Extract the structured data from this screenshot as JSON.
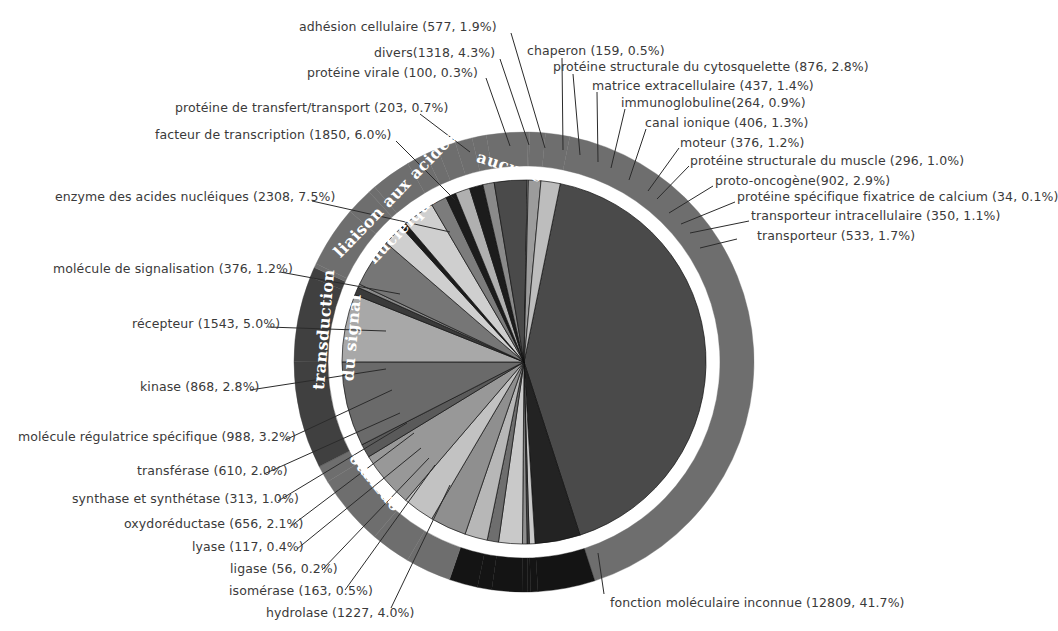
{
  "chart_data": {
    "type": "pie",
    "title": "",
    "subtitle": "",
    "xlabel": "",
    "ylabel": "",
    "legend_position": "callout-labels",
    "grid": false,
    "total": 30728,
    "center": {
      "x": 524,
      "y": 362
    },
    "outer_radius": 230,
    "ring_inner_radius": 196,
    "pie_radius": 182,
    "value_unit": "genes",
    "colors": {
      "dark_gray": "#404040",
      "mid_gray": "#6e6e6e",
      "light_gray": "#b7b7b7",
      "pale_gray": "#d2d2d2",
      "black": "#141414",
      "white": "#ffffff",
      "text": "#3a3a3a"
    },
    "groups": [
      {
        "name": "aucune",
        "fill": "#6e6e6e",
        "text_fill": "#ffffff"
      },
      {
        "name": "liaison aux acides nucléiques",
        "fill": "#404040",
        "text_fill": "#ffffff"
      },
      {
        "name": "transduction du signal",
        "fill": "#6e6e6e",
        "text_fill": "#ffffff"
      },
      {
        "name": "enzyme",
        "fill": "#141414",
        "text_fill": "#ffffff"
      },
      {
        "name": "",
        "fill": "#404040",
        "text_fill": "#ffffff"
      }
    ],
    "slices": [
      {
        "label": "fonction moléculaire inconnue",
        "value": 12809,
        "percent": 41.7,
        "fill": "#4a4a4a",
        "group": "aucune"
      },
      {
        "label": "hydrolase",
        "value": 1227,
        "percent": 4.0,
        "fill": "#232323",
        "group": "enzyme"
      },
      {
        "label": "isomérase",
        "value": 163,
        "percent": 0.5,
        "fill": "#c9c9c9",
        "group": "enzyme"
      },
      {
        "label": "ligase",
        "value": 56,
        "percent": 0.2,
        "fill": "#4a4a4a",
        "group": "enzyme"
      },
      {
        "label": "lyase",
        "value": 117,
        "percent": 0.4,
        "fill": "#8f8f8f",
        "group": "enzyme"
      },
      {
        "label": "oxydoréductase",
        "value": 656,
        "percent": 2.1,
        "fill": "#c9c9c9",
        "group": "enzyme"
      },
      {
        "label": "synthase et synthétase",
        "value": 313,
        "percent": 1.0,
        "fill": "#6e6e6e",
        "group": "enzyme"
      },
      {
        "label": "transférase",
        "value": 610,
        "percent": 2.0,
        "fill": "#b7b7b7",
        "group": "enzyme"
      },
      {
        "label": "molécule régulatrice spécifique",
        "value": 988,
        "percent": 3.2,
        "fill": "#8f8f8f",
        "group": "transduction du signal"
      },
      {
        "label": "kinase",
        "value": 868,
        "percent": 2.8,
        "fill": "#c2c2c2",
        "group": "transduction du signal"
      },
      {
        "label": "récepteur",
        "value": 1543,
        "percent": 5.0,
        "fill": "#989898",
        "group": "transduction du signal"
      },
      {
        "label": "molécule de signalisation",
        "value": 376,
        "percent": 1.2,
        "fill": "#5a5a5a",
        "group": "transduction du signal"
      },
      {
        "label": "enzyme des acides nucléiques",
        "value": 2308,
        "percent": 7.5,
        "fill": "#6a6a6a",
        "group": "liaison aux acides nucléiques"
      },
      {
        "label": "facteur de transcription",
        "value": 1850,
        "percent": 6.0,
        "fill": "#a8a8a8",
        "group": "liaison aux acides nucléiques"
      },
      {
        "label": "protéine de transfert/transport",
        "value": 203,
        "percent": 0.7,
        "fill": "#3a3a3a",
        "group": "liaison aux acides nucléiques"
      },
      {
        "label": "protéine virale",
        "value": 100,
        "percent": 0.3,
        "fill": "#8a8a8a",
        "group": "aucune"
      },
      {
        "label": "divers",
        "value": 1318,
        "percent": 4.3,
        "fill": "#767676",
        "group": "aucune"
      },
      {
        "label": "adhésion cellulaire",
        "value": 577,
        "percent": 1.9,
        "fill": "#cfcfcf",
        "group": "aucune"
      },
      {
        "label": "chaperon",
        "value": 159,
        "percent": 0.5,
        "fill": "#1c1c1c",
        "group": "aucune"
      },
      {
        "label": "protéine structurale du cytosquelette",
        "value": 876,
        "percent": 2.8,
        "fill": "#cfcfcf",
        "group": "aucune"
      },
      {
        "label": "matrice extracellulaire",
        "value": 437,
        "percent": 1.4,
        "fill": "#7c7c7c",
        "group": "aucune"
      },
      {
        "label": "immunoglobuline",
        "value": 264,
        "percent": 0.9,
        "fill": "#1c1c1c",
        "group": "aucune"
      },
      {
        "label": "canal ionique",
        "value": 406,
        "percent": 1.3,
        "fill": "#b0b0b0",
        "group": "aucune"
      },
      {
        "label": "moteur",
        "value": 376,
        "percent": 1.2,
        "fill": "#1c1c1c",
        "group": "aucune"
      },
      {
        "label": "protéine structurale du muscle",
        "value": 296,
        "percent": 1.0,
        "fill": "#8a8a8a",
        "group": "aucune"
      },
      {
        "label": "proto-oncogène",
        "value": 902,
        "percent": 2.9,
        "fill": "#4a4a4a",
        "group": "aucune"
      },
      {
        "label": "protéine spécifique fixatrice de calcium",
        "value": 34,
        "percent": 0.1,
        "fill": "#d8d8d8",
        "group": "aucune"
      },
      {
        "label": "transporteur intracellulaire",
        "value": 350,
        "percent": 1.1,
        "fill": "#9c9c9c",
        "group": "aucune"
      },
      {
        "label": "transporteur",
        "value": 533,
        "percent": 1.7,
        "fill": "#bdbdbd",
        "group": "aucune"
      }
    ]
  },
  "callouts": [
    {
      "id": "adhesion-cellulaire",
      "text": "adhésion cellulaire  (577, 1.9%)",
      "x": 299,
      "y": 20,
      "align": "left",
      "lx1": 511,
      "ly1": 33,
      "lx2": 545,
      "ly2": 148
    },
    {
      "id": "divers",
      "text": "divers(1318, 4.3%)",
      "x": 374,
      "y": 46,
      "align": "left",
      "lx1": 500,
      "ly1": 59,
      "lx2": 529,
      "ly2": 145
    },
    {
      "id": "proteine-virale",
      "text": "protéine virale  (100, 0.3%)",
      "x": 307,
      "y": 66,
      "align": "left",
      "lx1": 486,
      "ly1": 78,
      "lx2": 510,
      "ly2": 146
    },
    {
      "id": "chaperon",
      "text": "chaperon (159, 0.5%)",
      "x": 527,
      "y": 44,
      "align": "left",
      "lx1": 562,
      "ly1": 58,
      "lx2": 563,
      "ly2": 150
    },
    {
      "id": "cytosquelette",
      "text": "protéine structurale du cytosquelette  (876, 2.8%)",
      "x": 553,
      "y": 60,
      "align": "left",
      "lx1": 573,
      "ly1": 74,
      "lx2": 580,
      "ly2": 155
    },
    {
      "id": "matrice-extracellulaire",
      "text": "matrice extracellulaire (437, 1.4%)",
      "x": 592,
      "y": 79,
      "align": "left",
      "lx1": 597,
      "ly1": 92,
      "lx2": 598,
      "ly2": 162
    },
    {
      "id": "immunoglobuline",
      "text": "immunoglobuline(264, 0.9%)",
      "x": 621,
      "y": 96,
      "align": "left",
      "lx1": 625,
      "ly1": 109,
      "lx2": 611,
      "ly2": 168
    },
    {
      "id": "proteine-transfert",
      "text": "protéine de transfert/transport  (203, 0.7%)",
      "x": 175,
      "y": 101,
      "align": "left",
      "lx1": 420,
      "ly1": 114,
      "lx2": 470,
      "ly2": 152
    },
    {
      "id": "canal-ionique",
      "text": "canal ionique (406, 1.3%)",
      "x": 645,
      "y": 116,
      "align": "left",
      "lx1": 646,
      "ly1": 129,
      "lx2": 629,
      "ly2": 180
    },
    {
      "id": "facteur-transcription",
      "text": "facteur de transcription  (1850, 6.0%)",
      "x": 155,
      "y": 128,
      "align": "left",
      "lx1": 396,
      "ly1": 141,
      "lx2": 455,
      "ly2": 200
    },
    {
      "id": "moteur",
      "text": "moteur (376, 1.2%)",
      "x": 680,
      "y": 136,
      "align": "left",
      "lx1": 679,
      "ly1": 148,
      "lx2": 648,
      "ly2": 191
    },
    {
      "id": "muscle",
      "text": "protéine structurale du muscle (296, 1.0%)",
      "x": 690,
      "y": 154,
      "align": "left",
      "lx1": 689,
      "ly1": 166,
      "lx2": 657,
      "ly2": 199
    },
    {
      "id": "proto-oncogene",
      "text": "proto-oncogène(902, 2.9%)",
      "x": 715,
      "y": 174,
      "align": "left",
      "lx1": 713,
      "ly1": 186,
      "lx2": 669,
      "ly2": 213
    },
    {
      "id": "calcium",
      "text": "protéine spécifique fixatrice de calcium  (34, 0.1%)",
      "x": 737,
      "y": 190,
      "align": "left",
      "lx1": 735,
      "ly1": 202,
      "lx2": 681,
      "ly2": 224
    },
    {
      "id": "transporteur-intra",
      "text": "transporteur intracellulaire (350, 1.1%)",
      "x": 751,
      "y": 209,
      "align": "left",
      "lx1": 749,
      "ly1": 221,
      "lx2": 690,
      "ly2": 233
    },
    {
      "id": "transporteur",
      "text": "transporteur (533, 1.7%)",
      "x": 757,
      "y": 229,
      "align": "left",
      "lx1": 737,
      "ly1": 239,
      "lx2": 700,
      "ly2": 248
    },
    {
      "id": "enzyme-acides-nucl",
      "text": "enzyme des acides nucléiques (2308, 7.5%)",
      "x": 55,
      "y": 190,
      "align": "left",
      "lx1": 312,
      "ly1": 201,
      "lx2": 450,
      "ly2": 232
    },
    {
      "id": "molecule-signalisation",
      "text": "molécule de signalisation  (376, 1.2%)",
      "x": 53,
      "y": 262,
      "align": "left",
      "lx1": 280,
      "ly1": 272,
      "lx2": 400,
      "ly2": 294
    },
    {
      "id": "recepteur",
      "text": "récepteur (1543, 5.0%)",
      "x": 132,
      "y": 317,
      "align": "left",
      "lx1": 268,
      "ly1": 327,
      "lx2": 386,
      "ly2": 331
    },
    {
      "id": "kinase",
      "text": "kinase (868, 2.8%)",
      "x": 140,
      "y": 380,
      "align": "left",
      "lx1": 250,
      "ly1": 390,
      "lx2": 386,
      "ly2": 369
    },
    {
      "id": "molecule-regulatrice",
      "text": "molécule régulatrice spécifique (988, 3.2%)",
      "x": 18,
      "y": 430,
      "align": "left",
      "lx1": 285,
      "ly1": 440,
      "lx2": 392,
      "ly2": 390
    },
    {
      "id": "transferase",
      "text": "transférase (610, 2.0%)",
      "x": 137,
      "y": 464,
      "align": "left",
      "lx1": 264,
      "ly1": 474,
      "lx2": 400,
      "ly2": 413
    },
    {
      "id": "synthase",
      "text": "synthase et synthétase (313, 1.0%)",
      "x": 72,
      "y": 492,
      "align": "left",
      "lx1": 278,
      "ly1": 501,
      "lx2": 407,
      "ly2": 423
    },
    {
      "id": "oxydoreductase",
      "text": "oxydoréductase (656, 2.1%)",
      "x": 124,
      "y": 517,
      "align": "left",
      "lx1": 291,
      "ly1": 526,
      "lx2": 414,
      "ly2": 433
    },
    {
      "id": "lyase",
      "text": "lyase (117, 0.4%)",
      "x": 192,
      "y": 540,
      "align": "left",
      "lx1": 297,
      "ly1": 549,
      "lx2": 421,
      "ly2": 448
    },
    {
      "id": "ligase",
      "text": "ligase (56, 0.2%)",
      "x": 230,
      "y": 562,
      "align": "left",
      "lx1": 322,
      "ly1": 570,
      "lx2": 429,
      "ly2": 458
    },
    {
      "id": "isomerase",
      "text": "isomérase (163, 0.5%)",
      "x": 229,
      "y": 584,
      "align": "left",
      "lx1": 345,
      "ly1": 590,
      "lx2": 435,
      "ly2": 465
    },
    {
      "id": "hydrolase",
      "text": "hydrolase (1227, 4.0%)",
      "x": 266,
      "y": 606,
      "align": "left",
      "lx1": 391,
      "ly1": 608,
      "lx2": 450,
      "ly2": 485
    },
    {
      "id": "fonction-inconnue",
      "text": "fonction moléculaire inconnue (12809, 41.7%)",
      "x": 610,
      "y": 596,
      "align": "left",
      "lx1": 604,
      "ly1": 594,
      "lx2": 598,
      "ly2": 553
    }
  ],
  "ring_labels": [
    {
      "id": "ring-aucune",
      "text": "aucune",
      "x": 508,
      "y": 172,
      "rotate": 18
    },
    {
      "id": "ring-liaison",
      "text": "liaison aux acides",
      "x": 399,
      "y": 198,
      "rotate": -46
    },
    {
      "id": "ring-liaison2",
      "text": "nucléiques",
      "x": 410,
      "y": 228,
      "rotate": -46
    },
    {
      "id": "ring-transduction",
      "text": "transduction",
      "x": 329,
      "y": 330,
      "rotate": -85
    },
    {
      "id": "ring-transduction2",
      "text": "du signal",
      "x": 357,
      "y": 338,
      "rotate": -85
    },
    {
      "id": "ring-enzyme",
      "text": "enzyme",
      "x": 377,
      "y": 480,
      "rotate": -130
    }
  ]
}
